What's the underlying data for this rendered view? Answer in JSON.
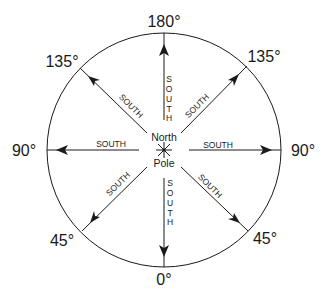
{
  "diagram": {
    "center_label_top": "North",
    "center_label_bottom": "Pole",
    "arrow_label": "SOUTH",
    "degrees": {
      "top": "180°",
      "top_left": "135°",
      "top_right": "135°",
      "left": "90°",
      "right": "90°",
      "bottom_left": "45°",
      "bottom_right": "45°",
      "bottom": "0°"
    },
    "vertical_letters": [
      "S",
      "O",
      "U",
      "T",
      "H"
    ],
    "colors": {
      "ink": "#1a1a1a",
      "background": "#ffffff"
    }
  }
}
